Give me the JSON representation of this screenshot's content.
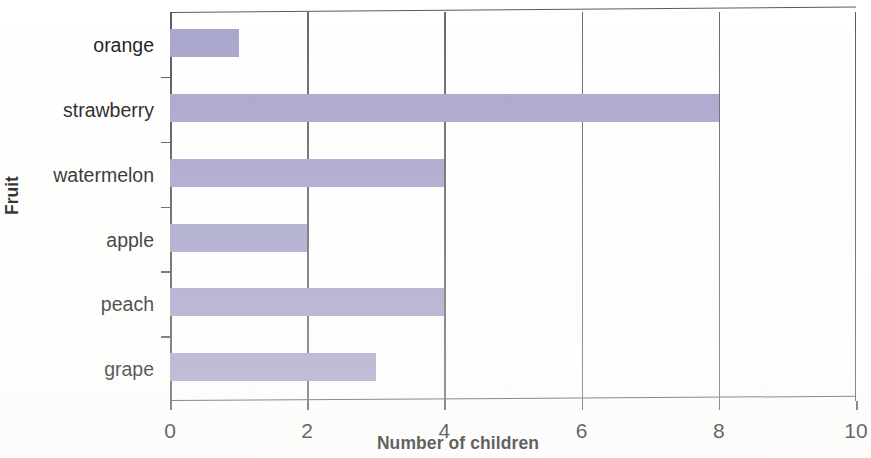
{
  "chart_data": {
    "type": "bar",
    "orientation": "horizontal",
    "title": "",
    "xlabel": "Number of children",
    "ylabel": "Fruit",
    "categories": [
      "orange",
      "strawberry",
      "watermelon",
      "apple",
      "peach",
      "grape"
    ],
    "values": [
      1,
      8,
      4,
      2,
      4,
      3
    ],
    "xlim": [
      0,
      10
    ],
    "xticks": [
      "0",
      "2",
      "4",
      "6",
      "8",
      "10"
    ],
    "xtick_values": [
      0,
      2,
      4,
      6,
      8,
      10
    ],
    "grid": "vertical",
    "legend": "none",
    "bar_color": "#a8a5cc",
    "axis_color": "#5b5b5b",
    "background_color": "#ffffff"
  },
  "axes": {
    "x_title": "Number of children",
    "y_title": "Fruit"
  }
}
